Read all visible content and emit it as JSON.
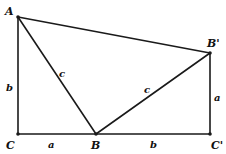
{
  "diagram": {
    "type": "geometry",
    "colors": {
      "line": "#1a1a1a",
      "text": "#111111",
      "background": "#ffffff"
    },
    "vertices": [
      {
        "id": "A",
        "label": "A",
        "x": 18,
        "y": 17,
        "lx": 5,
        "ly": 15
      },
      {
        "id": "Bp",
        "label": "B'",
        "x": 210,
        "y": 53,
        "lx": 207,
        "ly": 47
      },
      {
        "id": "C",
        "label": "C",
        "x": 18,
        "y": 134,
        "lx": 6,
        "ly": 149
      },
      {
        "id": "B",
        "label": "B",
        "x": 96,
        "y": 134,
        "lx": 91,
        "ly": 149
      },
      {
        "id": "Cp",
        "label": "C'",
        "x": 210,
        "y": 134,
        "lx": 211,
        "ly": 149
      }
    ],
    "edges": [
      {
        "from": "A",
        "to": "Bp",
        "label": ""
      },
      {
        "from": "A",
        "to": "C",
        "label": "b",
        "lx": 6,
        "ly": 91
      },
      {
        "from": "A",
        "to": "B",
        "label": "c",
        "lx": 59,
        "ly": 77
      },
      {
        "from": "B",
        "to": "Bp",
        "label": "c",
        "lx": 144,
        "ly": 93
      },
      {
        "from": "C",
        "to": "B",
        "label": "a",
        "lx": 48,
        "ly": 148
      },
      {
        "from": "B",
        "to": "Cp",
        "label": "b",
        "lx": 150,
        "ly": 148
      },
      {
        "from": "Bp",
        "to": "Cp",
        "label": "a",
        "lx": 214,
        "ly": 101
      }
    ]
  }
}
